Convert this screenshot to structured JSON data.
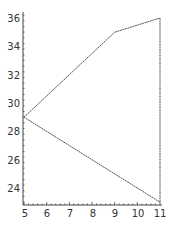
{
  "chart_data": {
    "type": "line",
    "title": "",
    "xlabel": "",
    "ylabel": "",
    "xlim": [
      5,
      11
    ],
    "ylim": [
      23,
      36
    ],
    "grid": false,
    "legend": null,
    "x_ticks": [
      5,
      6,
      7,
      8,
      9,
      10,
      11
    ],
    "y_ticks": [
      24,
      26,
      28,
      30,
      32,
      34,
      36
    ],
    "series": [
      {
        "name": "polygon",
        "points": [
          {
            "x": 5,
            "y": 29
          },
          {
            "x": 9,
            "y": 35
          },
          {
            "x": 11,
            "y": 36
          },
          {
            "x": 11,
            "y": 23
          },
          {
            "x": 5,
            "y": 29
          }
        ]
      }
    ],
    "line_color": "#555555"
  },
  "x_tick_labels": [
    "5",
    "6",
    "7",
    "8",
    "9",
    "10",
    "11"
  ],
  "y_tick_labels": [
    "24",
    "26",
    "28",
    "30",
    "32",
    "34",
    "36"
  ]
}
